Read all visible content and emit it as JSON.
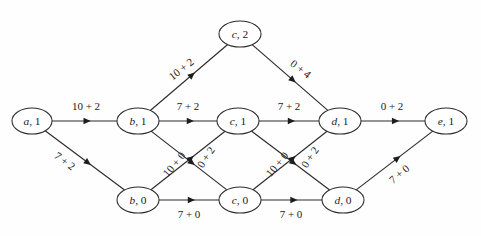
{
  "figure": {
    "background_color": "#fefefe",
    "stroke_color": "#2b2b2b",
    "text_color": "#1a1a1a",
    "width": 481,
    "height": 236
  },
  "caption": {
    "text": ""
  },
  "chart_data": {
    "type": "diagram",
    "subtype": "directed-graph-trellis",
    "title": "",
    "node_label_format": "stage, state",
    "edge_label_format": "cost + cost",
    "nodes": [
      {
        "id": "a1",
        "stage": "a",
        "state": "1",
        "label": "a, 1",
        "x": 32,
        "y": 121,
        "rx": 20,
        "ry": 13
      },
      {
        "id": "b1",
        "stage": "b",
        "state": "1",
        "label": "b, 1",
        "x": 138,
        "y": 121,
        "rx": 21,
        "ry": 13
      },
      {
        "id": "c1",
        "stage": "c",
        "state": "1",
        "label": "c, 1",
        "x": 238,
        "y": 121,
        "rx": 21,
        "ry": 13
      },
      {
        "id": "d1",
        "stage": "d",
        "state": "1",
        "label": "d, 1",
        "x": 340,
        "y": 121,
        "rx": 21,
        "ry": 13
      },
      {
        "id": "e1",
        "stage": "e",
        "state": "1",
        "label": "e, 1",
        "x": 446,
        "y": 121,
        "rx": 21,
        "ry": 13
      },
      {
        "id": "c2",
        "stage": "c",
        "state": "2",
        "label": "c, 2",
        "x": 240,
        "y": 34,
        "rx": 21,
        "ry": 13
      },
      {
        "id": "b0",
        "stage": "b",
        "state": "0",
        "label": "b, 0",
        "x": 138,
        "y": 200,
        "rx": 21,
        "ry": 13
      },
      {
        "id": "c0",
        "stage": "c",
        "state": "0",
        "label": "c, 0",
        "x": 240,
        "y": 200,
        "rx": 21,
        "ry": 13
      },
      {
        "id": "d0",
        "stage": "d",
        "state": "0",
        "label": "d, 0",
        "x": 343,
        "y": 200,
        "rx": 21,
        "ry": 13
      }
    ],
    "edges": [
      {
        "id": "e_a1_b1",
        "from": "a1",
        "to": "b1",
        "label": "10 + 2",
        "label_x": 86,
        "label_y": 107,
        "label_rotate": 0
      },
      {
        "id": "e_a1_b0",
        "from": "a1",
        "to": "b0",
        "label": "7 + 2",
        "label_x": 64,
        "label_y": 162,
        "label_rotate": 37
      },
      {
        "id": "e_b1_c2",
        "from": "b1",
        "to": "c2",
        "label": "10 + 2",
        "label_x": 182,
        "label_y": 70,
        "label_rotate": -38
      },
      {
        "id": "e_b1_c1",
        "from": "b1",
        "to": "c1",
        "label": "7 + 2",
        "label_x": 188,
        "label_y": 107,
        "label_rotate": 0
      },
      {
        "id": "e_b1_c0",
        "from": "b1",
        "to": "c0",
        "label": "0 + 2",
        "label_x": 207,
        "label_y": 158,
        "label_rotate": -56
      },
      {
        "id": "e_b0_c1",
        "from": "b0",
        "to": "c1",
        "label": "10 + 0",
        "label_x": 175,
        "label_y": 165,
        "label_rotate": -50
      },
      {
        "id": "e_b0_c0",
        "from": "b0",
        "to": "c0",
        "label": "7 + 0",
        "label_x": 189,
        "label_y": 215,
        "label_rotate": 0
      },
      {
        "id": "e_c2_d1",
        "from": "c2",
        "to": "d1",
        "label": "0 + 4",
        "label_x": 300,
        "label_y": 70,
        "label_rotate": 38
      },
      {
        "id": "e_c1_d1",
        "from": "c1",
        "to": "d1",
        "label": "7 + 2",
        "label_x": 289,
        "label_y": 107,
        "label_rotate": 0
      },
      {
        "id": "e_c1_d0",
        "from": "c1",
        "to": "d0",
        "label": "0 + 2",
        "label_x": 311,
        "label_y": 158,
        "label_rotate": -56
      },
      {
        "id": "e_c0_d1",
        "from": "c0",
        "to": "d1",
        "label": "10 + 0",
        "label_x": 278,
        "label_y": 165,
        "label_rotate": -50
      },
      {
        "id": "e_c0_d0",
        "from": "c0",
        "to": "d0",
        "label": "7 + 0",
        "label_x": 291,
        "label_y": 215,
        "label_rotate": 0
      },
      {
        "id": "e_d1_e1",
        "from": "d1",
        "to": "e1",
        "label": "0 + 2",
        "label_x": 392,
        "label_y": 107,
        "label_rotate": 0
      },
      {
        "id": "e_d0_e1",
        "from": "d0",
        "to": "e1",
        "label": "7 + 0",
        "label_x": 400,
        "label_y": 175,
        "label_rotate": -40
      }
    ]
  }
}
